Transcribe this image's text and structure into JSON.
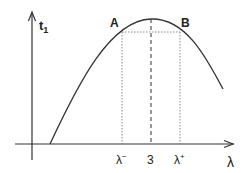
{
  "diagram": {
    "y_axis_label": "t",
    "y_axis_subscript": "1",
    "x_axis_label": "λ",
    "points": [
      {
        "name": "A",
        "label": "A"
      },
      {
        "name": "B",
        "label": "B"
      }
    ],
    "x_ticks": [
      {
        "label": "λ",
        "sup": "−"
      },
      {
        "label": "3",
        "sup": ""
      },
      {
        "label": "λ",
        "sup": "+"
      }
    ],
    "colors": {
      "line": "#333333",
      "dotted": "#888888",
      "background": "#ffffff"
    }
  }
}
